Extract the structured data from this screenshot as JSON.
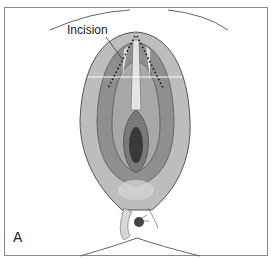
{
  "figure": {
    "panel_label": "A",
    "annotations": [
      {
        "text": "Incision",
        "target": "dotted incision line"
      }
    ],
    "colors": {
      "outer_tissue": "#b9b9b9",
      "mid_tissue": "#8f8f8f",
      "inner_highlight": "#e4e4e4",
      "deep_center": "#3a3a3a",
      "outline": "#555555",
      "frame": "#8a8a8a"
    }
  }
}
